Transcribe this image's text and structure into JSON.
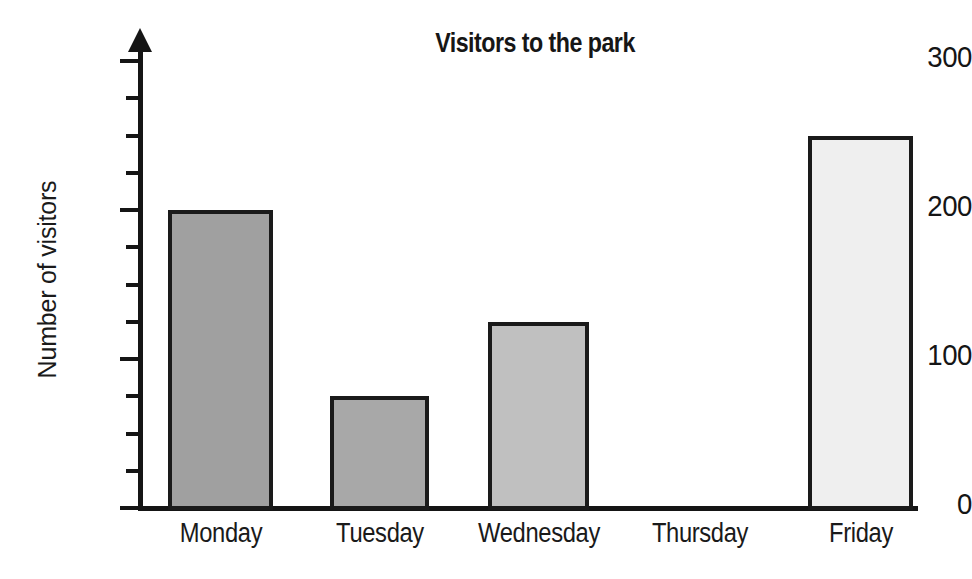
{
  "chart_data": {
    "type": "bar",
    "title": "Visitors to the park",
    "xlabel": "",
    "ylabel": "Number of visitors",
    "categories": [
      "Monday",
      "Tuesday",
      "Wednesday",
      "Thursday",
      "Friday"
    ],
    "values": [
      200,
      75,
      125,
      0,
      250
    ],
    "ylim": [
      0,
      300
    ],
    "y_major_ticks": [
      0,
      100,
      200,
      300
    ],
    "y_major_tick_labels": [
      "0",
      "100",
      "200",
      "300"
    ],
    "y_minor_tick_interval": 25,
    "grid": false,
    "legend": null,
    "bar_colors": [
      "#a0a0a0",
      "#a8a8a8",
      "#c0c0c0",
      "#ffffff",
      "#efefef"
    ],
    "bar_edge_color": "#1a1a1a",
    "axis_color": "#151515",
    "background_color": "#ffffff"
  }
}
